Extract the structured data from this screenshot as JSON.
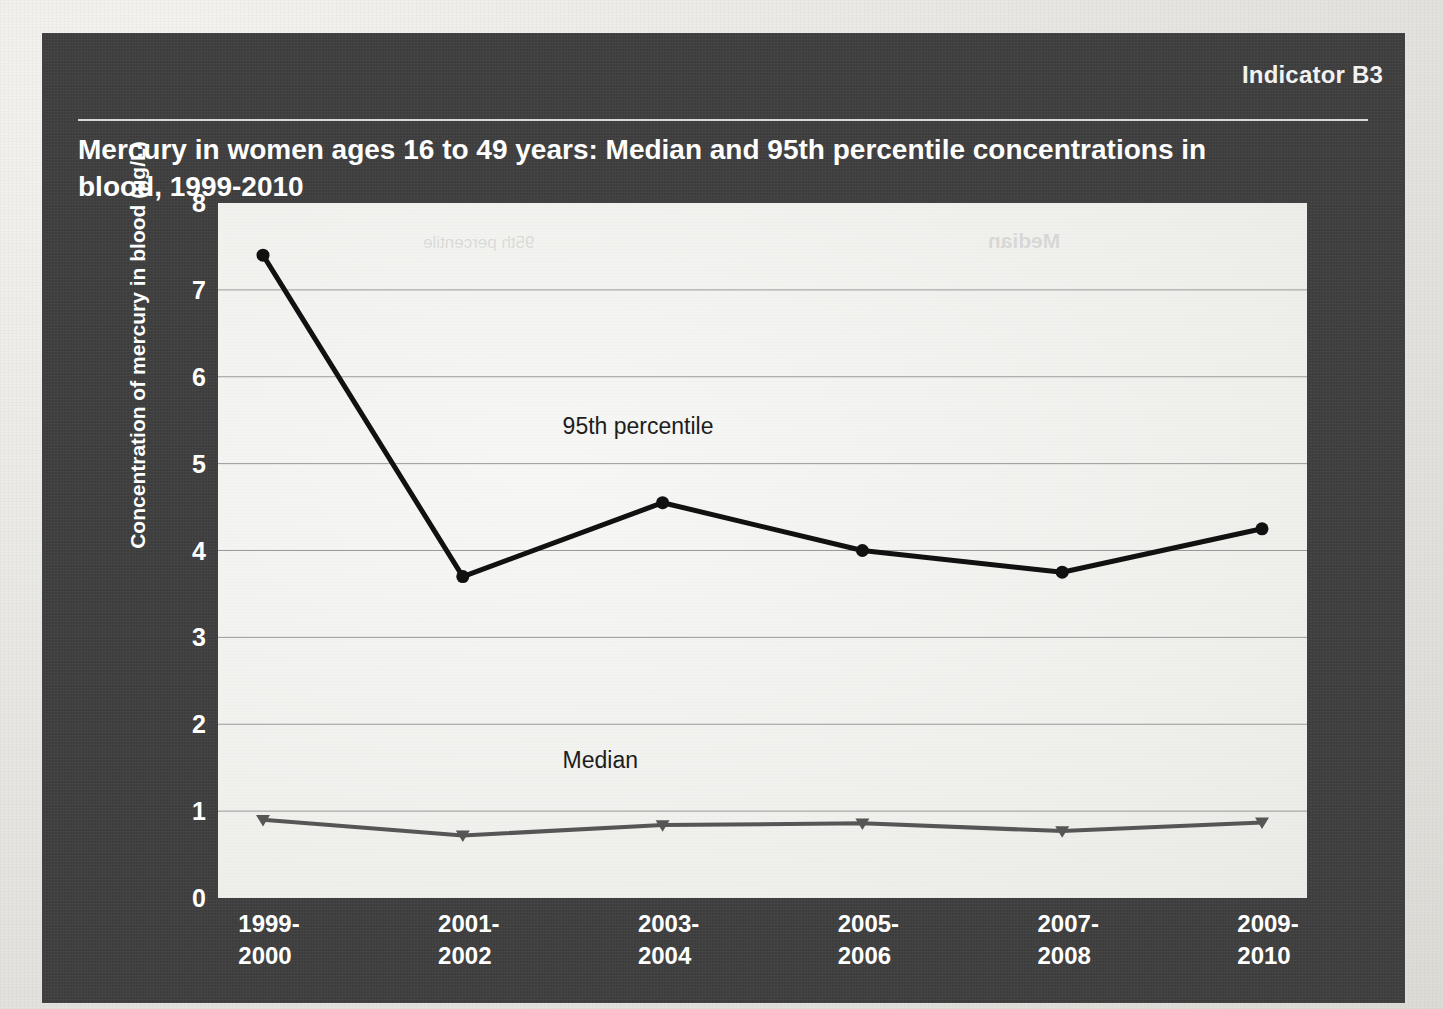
{
  "figure": {
    "indicator_label": "Indicator B3",
    "title": "Mercury in women ages 16 to 49 years: Median and 95th percentile concentrations in blood, 1999-2010",
    "panel_color": "#3f3f3f",
    "plot_background": "#f3f3f1",
    "ghost_text_median": "Median",
    "ghost_text_percentile": "95th percentile"
  },
  "chart_data": {
    "type": "line",
    "title": "Mercury in women ages 16 to 49 years: Median and 95th percentile concentrations in blood, 1999-2010",
    "xlabel": "",
    "ylabel": "Concentration of mercury in blood (µg/L)",
    "categories": [
      "1999-2000",
      "2001-2002",
      "2003-2004",
      "2005-2006",
      "2007-2008",
      "2009-2010"
    ],
    "category_lines": [
      [
        "1999-",
        "2000"
      ],
      [
        "2001-",
        "2002"
      ],
      [
        "2003-",
        "2004"
      ],
      [
        "2005-",
        "2006"
      ],
      [
        "2007-",
        "2008"
      ],
      [
        "2009-",
        "2010"
      ]
    ],
    "ylim": [
      0,
      8
    ],
    "yticks": [
      0,
      1,
      2,
      3,
      4,
      5,
      6,
      7,
      8
    ],
    "grid": true,
    "grid_axis": "y",
    "legend_position": "inline-annotation",
    "series": [
      {
        "name": "95th percentile",
        "color": "#111111",
        "marker": "circle",
        "values": [
          7.4,
          3.7,
          4.55,
          4.0,
          3.75,
          4.25
        ],
        "label_x": "2003-2004",
        "label_y": 5.4
      },
      {
        "name": "Median",
        "color": "#565656",
        "marker": "triangle-down",
        "values": [
          0.9,
          0.72,
          0.84,
          0.86,
          0.77,
          0.87
        ],
        "label_x": "2003-2004",
        "label_y": 1.55
      }
    ],
    "annotations": [
      {
        "text": "95th percentile",
        "value_x": "2003-2004",
        "value_y": 5.4
      },
      {
        "text": "Median",
        "value_x": "2003-2004",
        "value_y": 1.55
      }
    ]
  }
}
